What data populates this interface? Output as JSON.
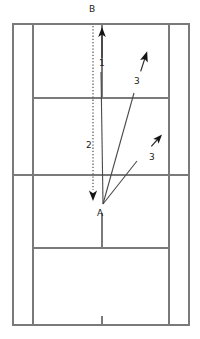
{
  "diagram": {
    "colors": {
      "court_line": "#7a7a7a",
      "court_line_light": "#8e8e8e",
      "annotation": "#3a3a3a",
      "label_text": "#222222",
      "background": "#ffffff"
    },
    "court": {
      "name": "badminton-court",
      "outer": {
        "left": 13,
        "top": 24,
        "right": 189,
        "bottom": 325
      },
      "singles_sideline_left_x": 33,
      "singles_sideline_right_x": 169,
      "center_line_x": 102,
      "net_line_y": 175,
      "far_short_service_line_y": 98,
      "near_short_service_line_y": 248,
      "far_long_service_line_y": 24,
      "near_baseline_y": 325
    },
    "points": [
      {
        "id": "A",
        "label": "A",
        "x": 103,
        "y": 204,
        "text_x": 98,
        "text_y": 213
      },
      {
        "id": "B",
        "label": "B",
        "x": 93,
        "y": 24,
        "text_x": 89,
        "text_y": 6
      }
    ],
    "shots": [
      {
        "id": "shot-1",
        "label": "1",
        "label_x": 103,
        "label_y": 62,
        "style": "solid",
        "from": "A",
        "x1": 103,
        "y1": 204,
        "x2": 101,
        "y2": 72,
        "arrow": {
          "x": 102,
          "y": 31,
          "angle": 0
        }
      },
      {
        "id": "shot-2",
        "label": "2",
        "label_x": 88,
        "label_y": 145,
        "style": "dotted",
        "from": "B",
        "x1": 93,
        "y1": 24,
        "x2": 93,
        "y2": 196,
        "arrow": {
          "x": 93,
          "y": 199,
          "angle": 180
        }
      },
      {
        "id": "shot-3a",
        "label": "3",
        "label_x": 136,
        "label_y": 80,
        "style": "solid",
        "from": "A",
        "x1": 103,
        "y1": 204,
        "x2": 134,
        "y2": 93,
        "arrow": {
          "x": 145,
          "y": 56,
          "angle": 16
        }
      },
      {
        "id": "shot-3b",
        "label": "3",
        "label_x": 150,
        "label_y": 156,
        "style": "solid",
        "from": "A",
        "x1": 103,
        "y1": 204,
        "x2": 137,
        "y2": 161,
        "arrow": {
          "x": 158,
          "y": 137,
          "angle": 40
        }
      }
    ],
    "legend_labels": [
      "B",
      "1",
      "3",
      "2",
      "3",
      "A"
    ]
  }
}
